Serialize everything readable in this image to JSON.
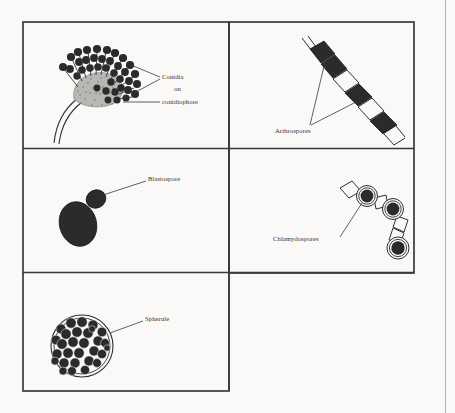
{
  "figure": {
    "title_hidden": "",
    "background_color": "#faf9f7",
    "ink_color": "#2b2b2b",
    "line_color": "#3a3a3a",
    "panels": [
      {
        "id": "conidia-panel",
        "position": "top-left",
        "label_lines": [
          "Conidia",
          "on",
          "conidiophore"
        ],
        "structure_name": "conidiophore-with-conidia"
      },
      {
        "id": "arthrospores-panel",
        "position": "top-right",
        "label_lines": [
          "Arthrospores"
        ],
        "structure_name": "segmented-hypha-with-arthrospores"
      },
      {
        "id": "blastospore-panel",
        "position": "middle-left",
        "label_lines": [
          "Blastospore"
        ],
        "structure_name": "budding-yeast-cell"
      },
      {
        "id": "chlamydospores-panel",
        "position": "middle-right",
        "label_lines": [
          "Chlamydospores"
        ],
        "structure_name": "hyphal-chain-with-chlamydospores"
      },
      {
        "id": "spherule-panel",
        "position": "bottom-left",
        "label_lines": [
          "Spherule"
        ],
        "structure_name": "spherule-packed-with-endospores"
      }
    ],
    "labels": {
      "conidia": "Conidia",
      "on": "on",
      "conidiophore": "conidiophore",
      "arthrospores": "Arthrospores",
      "blastospore": "Blastospore",
      "chlamydospores": "Chlamydospores",
      "spherule": "Spherule"
    }
  }
}
